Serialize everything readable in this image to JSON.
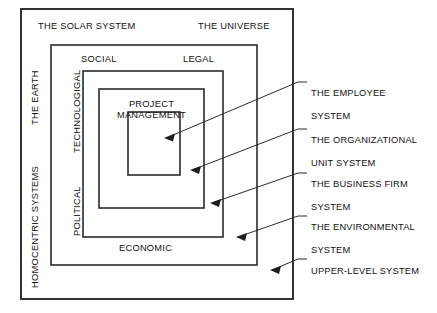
{
  "diagram": {
    "stroke_color": "#2b2b2b",
    "background_color": "#ffffff",
    "outer_labels": {
      "solar_system": "THE SOLAR SYSTEM",
      "universe": "THE UNIVERSE",
      "homocentric_systems": "HOMOCENTRIC SYSTEMS",
      "the_earth": "THE EARTH"
    },
    "second_ring_labels": {
      "social": "SOCIAL",
      "legal": "LEGAL",
      "economic": "ECONOMIC",
      "political": "POLITICAL",
      "technological": "TECHNOLOGIGAL"
    },
    "core_label": {
      "line1": "PROJECT",
      "line2": "MANAGEMENT"
    }
  },
  "callouts": [
    {
      "id": "employee",
      "line1": "THE EMPLOYEE",
      "line2": "SYSTEM"
    },
    {
      "id": "organizational",
      "line1": "THE ORGANIZATIONAL",
      "line2": "UNIT SYSTEM"
    },
    {
      "id": "business",
      "line1": "THE BUSINESS FIRM",
      "line2": "SYSTEM"
    },
    {
      "id": "environmental",
      "line1": "THE ENVIRONMENTAL",
      "line2": "SYSTEM"
    },
    {
      "id": "upper",
      "line1": "UPPER-LEVEL SYSTEM",
      "line2": ""
    }
  ]
}
